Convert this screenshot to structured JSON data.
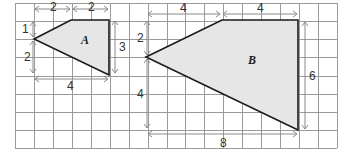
{
  "figure": {
    "grid": {
      "columns": 17,
      "rows": 8
    },
    "shapes": [
      {
        "name": "A",
        "label": "A",
        "fill": "#e6e6e6",
        "dimensions": {
          "top_left_segment": "2",
          "top_right_segment": "2",
          "left_upper": "1",
          "left_lower": "2",
          "right_side": "3",
          "bottom_width": "4"
        }
      },
      {
        "name": "B",
        "label": "B",
        "fill": "#e6e6e6",
        "dimensions": {
          "top_left_segment": "4",
          "top_right_segment": "4",
          "left_upper": "2",
          "left_lower": "4",
          "right_side": "6",
          "bottom_width": "8"
        }
      }
    ]
  }
}
